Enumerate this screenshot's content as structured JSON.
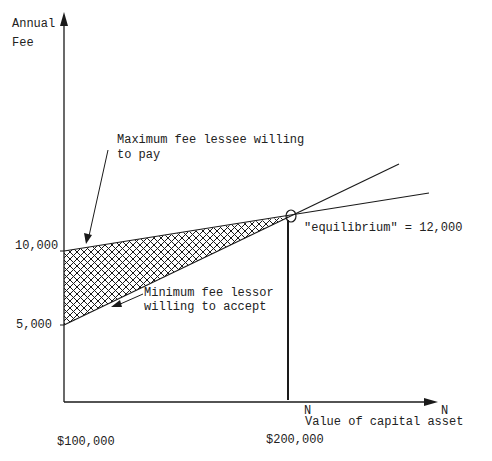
{
  "diagram": {
    "y_axis": {
      "label_line1": "Annual",
      "label_line2": "Fee"
    },
    "x_axis": {
      "end_label": "N",
      "label": "Value of capital asset"
    },
    "y_ticks": [
      {
        "label": "10,000",
        "value": 10000
      },
      {
        "label": "5,000",
        "value": 5000
      }
    ],
    "x_ticks": [
      {
        "label": "$100,000",
        "value": 100000
      },
      {
        "label": "$200,000",
        "value": 200000
      }
    ],
    "equilibrium_marker": {
      "label": "N"
    },
    "annotations": {
      "max_fee": {
        "line1": "Maximum fee lessee willing",
        "line2": "to pay"
      },
      "min_fee": {
        "line1": "Minimum fee lessor",
        "line2": "willing to accept"
      },
      "equilibrium": "\"equilibrium\" = 12,000"
    },
    "curves": [
      {
        "name": "Maximum fee lessee willing to pay",
        "start": [
          100000,
          10000
        ],
        "end": [
          200000,
          12000
        ]
      },
      {
        "name": "Minimum fee lessor willing to accept",
        "start": [
          100000,
          5000
        ],
        "end": [
          200000,
          12000
        ]
      }
    ],
    "shaded_region": "cross-hatched bargaining range between the two lines",
    "colors": {
      "ink": "#1a1a1a",
      "background": "#ffffff"
    }
  }
}
